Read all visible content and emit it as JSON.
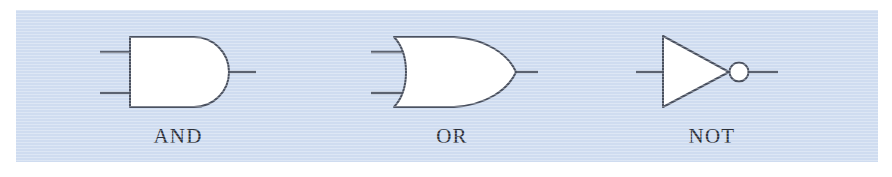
{
  "figure": {
    "kind": "logic-gate-symbols-diagram",
    "panel": {
      "background_color": "#cfdcf0",
      "page_background_color": "#ffffff"
    },
    "style": {
      "stroke_color": "#4a5160",
      "fill_color": "#ffffff",
      "lead_color": "#5b6270",
      "label_color": "#2b2f38",
      "stroke_width": 2
    },
    "gates": [
      {
        "id": "and-gate",
        "label": "AND",
        "symbol": "and",
        "inputs": 2,
        "outputs": 1,
        "inverting_bubble": false,
        "label_center_x": 178,
        "label_baseline_y": 137
      },
      {
        "id": "or-gate",
        "label": "OR",
        "symbol": "or",
        "inputs": 2,
        "outputs": 1,
        "inverting_bubble": false,
        "label_center_x": 452,
        "label_baseline_y": 137
      },
      {
        "id": "not-gate",
        "label": "NOT",
        "symbol": "not",
        "inputs": 1,
        "outputs": 1,
        "inverting_bubble": true,
        "label_center_x": 712,
        "label_baseline_y": 137
      }
    ]
  }
}
